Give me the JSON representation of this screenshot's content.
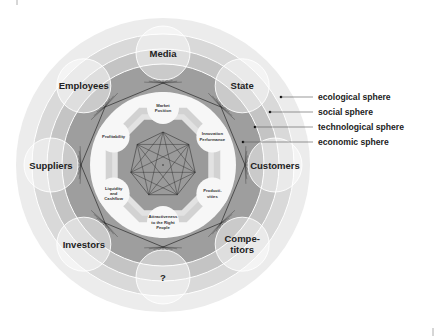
{
  "diagram": {
    "center": [
      163,
      165
    ],
    "colors": {
      "ecological": "#ececec",
      "social": "#d9d9d9",
      "technological": "#c4c4c4",
      "economic": "#9e9e9e",
      "inner_white": "#f7f7f7",
      "inner_band": "#d2d2d2",
      "core": "#9a9a9a",
      "lines": "#2a2a2a",
      "bubble": "rgba(255,255,255,0.45)",
      "bubble_stroke": "#ffffff"
    },
    "stakeholders": [
      {
        "label": "Media",
        "lines": [
          "Media"
        ],
        "angle": -90
      },
      {
        "label": "State",
        "lines": [
          "State"
        ],
        "angle": -45
      },
      {
        "label": "Customers",
        "lines": [
          "Customers"
        ],
        "angle": 0
      },
      {
        "label": "Competitors",
        "lines": [
          "Compe-",
          "titors"
        ],
        "angle": 45
      },
      {
        "label": "?",
        "lines": [
          "?"
        ],
        "angle": 90
      },
      {
        "label": "Investors",
        "lines": [
          "Investors"
        ],
        "angle": 135
      },
      {
        "label": "Suppliers",
        "lines": [
          "Suppliers"
        ],
        "angle": 180
      },
      {
        "label": "Employees",
        "lines": [
          "Employees"
        ],
        "angle": 225
      }
    ],
    "success_factors": [
      {
        "label": "Market Position",
        "lines": [
          "Market",
          "Position"
        ],
        "angle": -90
      },
      {
        "label": "Innovation Performance",
        "lines": [
          "Innovation",
          "Performance"
        ],
        "angle": -30
      },
      {
        "label": "Productivities",
        "lines": [
          "Producti-",
          "vities"
        ],
        "angle": 30
      },
      {
        "label": "Attractiveness to the Right People",
        "lines": [
          "Attractiveness",
          "to the Right",
          "People"
        ],
        "angle": 90
      },
      {
        "label": "Liquidity and Cashflow",
        "lines": [
          "Liquidity",
          "and",
          "Cashflow"
        ],
        "angle": 150
      },
      {
        "label": "Profitability",
        "lines": [
          "Profitability"
        ],
        "angle": 210
      }
    ],
    "legend": [
      {
        "label": "ecological sphere",
        "dot": [
          281,
          97
        ],
        "y": 98
      },
      {
        "label": "social sphere",
        "dot": [
          270,
          112
        ],
        "y": 112
      },
      {
        "label": "technological sphere",
        "dot": [
          255,
          127
        ],
        "y": 127
      },
      {
        "label": "economic sphere",
        "dot": [
          243,
          142
        ],
        "y": 142
      }
    ]
  }
}
